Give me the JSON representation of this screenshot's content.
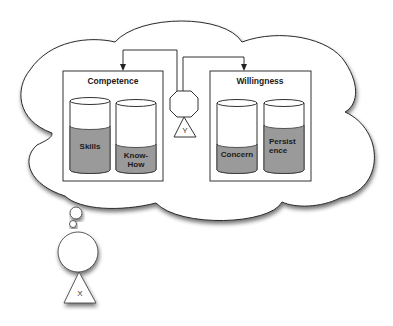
{
  "diagram": {
    "type": "thought-bubble concept diagram",
    "person_x": {
      "label": "X"
    },
    "person_y": {
      "label": "Y"
    },
    "groups": [
      {
        "title": "Competence",
        "containers": [
          {
            "label_line1": "Skills",
            "label_line2": "",
            "fill_level": 0.62
          },
          {
            "label_line1": "Know-",
            "label_line2": "How",
            "fill_level": 0.4
          }
        ]
      },
      {
        "title": "Willingness",
        "containers": [
          {
            "label_line1": "Concern",
            "label_line2": "",
            "fill_level": 0.4
          },
          {
            "label_line1": "Persist",
            "label_line2": "ence",
            "fill_level": 0.62
          }
        ]
      }
    ],
    "colors": {
      "fill": "#9a9a9a",
      "stroke": "#333333",
      "background": "#ffffff"
    }
  }
}
